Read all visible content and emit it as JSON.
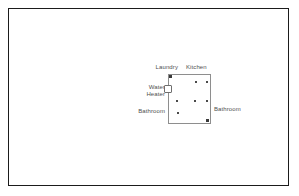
{
  "figure": {
    "name": "floor-plan-diagram",
    "width": 299,
    "height": 196,
    "background_color": "#ffffff",
    "frame_color": "#1b1b1b"
  },
  "plan": {
    "wall_color": "#8e8e8e",
    "fixture_color": "#4a4a4a",
    "rooms": [
      {
        "id": "laundry",
        "label": "Laundry"
      },
      {
        "id": "kitchen",
        "label": "Kitchen"
      },
      {
        "id": "bathroom-left",
        "label": "Bathroom"
      },
      {
        "id": "bathroom-right",
        "label": "Bathroom"
      }
    ],
    "equipment": [
      {
        "id": "water-heater",
        "label": "Water Heater",
        "label_line1": "Water",
        "label_line2": "Heater",
        "symbol": "open-square"
      }
    ],
    "fixtures": [
      {
        "id": "fixture-nw-corner",
        "x": 1,
        "y": 1,
        "type": "corner"
      },
      {
        "id": "fixture-n-mid",
        "x": 27,
        "y": 7,
        "type": "dot"
      },
      {
        "id": "fixture-ne",
        "x": 38,
        "y": 7,
        "type": "dot"
      },
      {
        "id": "fixture-w-upper",
        "x": 8,
        "y": 26,
        "type": "dot"
      },
      {
        "id": "fixture-c-mid",
        "x": 26,
        "y": 26,
        "type": "dot"
      },
      {
        "id": "fixture-e-mid",
        "x": 38,
        "y": 26,
        "type": "dot"
      },
      {
        "id": "fixture-w-lower",
        "x": 9,
        "y": 38,
        "type": "dot"
      },
      {
        "id": "fixture-se-corner",
        "x": 38,
        "y": 45,
        "type": "corner"
      }
    ]
  }
}
